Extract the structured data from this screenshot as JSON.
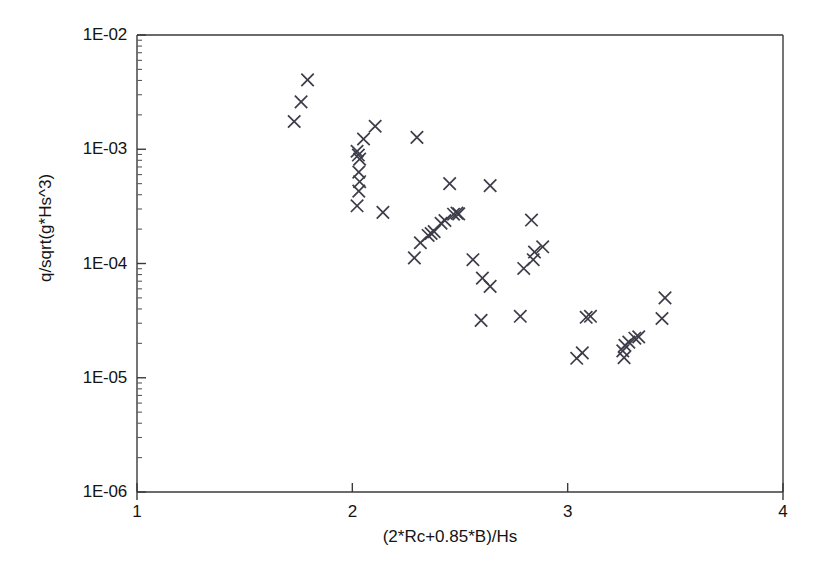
{
  "chart_data": {
    "type": "scatter",
    "title": "",
    "xlabel": "(2*Rc+0.85*B)/Hs",
    "ylabel": "q/sqrt(g*Hs^3)",
    "xscale": "linear",
    "yscale": "log",
    "xlim": [
      1,
      4
    ],
    "ylim": [
      1e-06,
      0.01
    ],
    "grid": false,
    "legend": null,
    "marker": "x",
    "marker_color": "#3c3c4a",
    "xticks": [
      1,
      2,
      3,
      4
    ],
    "xticklabels": [
      "1",
      "2",
      "3",
      "4"
    ],
    "yticks": [
      1e-06,
      1e-05,
      0.0001,
      0.001,
      0.01
    ],
    "yticklabels": [
      "1E-06",
      "1E-05",
      "1E-04",
      "1E-03",
      "1E-02"
    ],
    "y_minor_ticks": true,
    "series": [
      {
        "name": "overtopping data",
        "points": [
          [
            1.762,
            0.0026
          ],
          [
            1.73,
            0.00175
          ],
          [
            1.792,
            0.00405
          ],
          [
            2.022,
            0.00096
          ],
          [
            2.028,
            0.00089
          ],
          [
            2.034,
            0.00082
          ],
          [
            2.03,
            0.00063
          ],
          [
            2.034,
            0.00052
          ],
          [
            2.03,
            0.00043
          ],
          [
            2.022,
            0.00032
          ],
          [
            2.052,
            0.00123
          ],
          [
            2.106,
            0.00159
          ],
          [
            2.142,
            0.00028
          ],
          [
            2.3,
            0.00127
          ],
          [
            2.288,
            0.000112
          ],
          [
            2.316,
            0.000152
          ],
          [
            2.352,
            0.000176
          ],
          [
            2.366,
            0.000183
          ],
          [
            2.38,
            0.00019
          ],
          [
            2.412,
            0.000225
          ],
          [
            2.43,
            0.000238
          ],
          [
            2.47,
            0.00027
          ],
          [
            2.486,
            0.000276
          ],
          [
            2.494,
            0.000272
          ],
          [
            2.452,
            0.0005
          ],
          [
            2.56,
            0.000108
          ],
          [
            2.604,
            7.45e-05
          ],
          [
            2.64,
            6.3e-05
          ],
          [
            2.598,
            3.18e-05
          ],
          [
            2.64,
            0.00048
          ],
          [
            2.78,
            3.45e-05
          ],
          [
            2.796,
            9.05e-05
          ],
          [
            2.84,
            0.000108
          ],
          [
            2.846,
            0.000126
          ],
          [
            2.832,
            0.00024
          ],
          [
            2.884,
            0.00014
          ],
          [
            3.042,
            1.48e-05
          ],
          [
            3.068,
            1.65e-05
          ],
          [
            3.086,
            3.38e-05
          ],
          [
            3.106,
            3.45e-05
          ],
          [
            3.256,
            1.72e-05
          ],
          [
            3.262,
            1.5e-05
          ],
          [
            3.266,
            1.92e-05
          ],
          [
            3.284,
            2.05e-05
          ],
          [
            3.312,
            2.22e-05
          ],
          [
            3.33,
            2.28e-05
          ],
          [
            3.438,
            3.3e-05
          ],
          [
            3.452,
            5e-05
          ]
        ]
      }
    ]
  },
  "axes": {
    "x_label": "(2*Rc+0.85*B)/Hs",
    "y_label": "q/sqrt(g*Hs^3)",
    "x_tick_labels": [
      "1",
      "2",
      "3",
      "4"
    ],
    "y_tick_labels": [
      "1E-02",
      "1E-03",
      "1E-04",
      "1E-05",
      "1E-06"
    ]
  }
}
